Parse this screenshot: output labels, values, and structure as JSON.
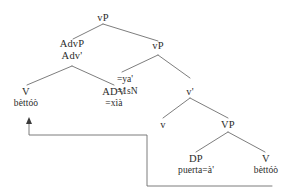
{
  "figure": {
    "type": "syntax-tree",
    "line_color": "#6e6e6e",
    "text_color": "#2b2b2b",
    "background": "#ffffff"
  },
  "nodes": {
    "root_vP": {
      "label": "vP",
      "word": ""
    },
    "advp": {
      "label": "AdvP",
      "word": ""
    },
    "adv_bar": {
      "label": "Adv'",
      "word": ""
    },
    "inner_vP": {
      "label": "vP",
      "word": ""
    },
    "v_left": {
      "label": "V",
      "word": "bèttóò"
    },
    "adv": {
      "label": "ADV",
      "word": "=xìà"
    },
    "v_bar": {
      "label": "v'",
      "word": ""
    },
    "little_v": {
      "label": "v",
      "word": ""
    },
    "VP": {
      "label": "VP",
      "word": ""
    },
    "dp": {
      "label": "DP",
      "word": "puerta=à'"
    },
    "v_right": {
      "label": "V",
      "word": "bèttóò"
    }
  },
  "gloss": {
    "form": "=ya'",
    "meaning": "=1sN"
  },
  "movement": {
    "name": "head-movement-arrow",
    "from": "v_right",
    "to": "v_left",
    "arrowhead": "up"
  }
}
